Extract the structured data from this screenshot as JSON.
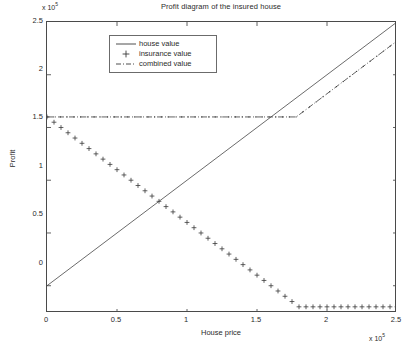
{
  "figure": {
    "title": "Profit diagram of the insured house",
    "background": "#ffffff",
    "axis_color": "#4a4a4a",
    "text_color": "#2b2b2b"
  },
  "axes": {
    "x_label": "House price",
    "y_label": "Profit",
    "x_exponent_base": "x 10",
    "x_exponent_power": "5",
    "y_exponent_base": "x 10",
    "y_exponent_power": "5",
    "x_ticks": [
      "0",
      "0.5",
      "1",
      "1.5",
      "2",
      "2.5"
    ],
    "y_ticks": [
      "0",
      "0.5",
      "1",
      "1.5",
      "2",
      "2.5"
    ]
  },
  "legend": {
    "entries": [
      {
        "label": "house value",
        "style": "solid-line",
        "color": "#3a3a3a"
      },
      {
        "label": "insurance value",
        "style": "plus-marker",
        "color": "#3a3a3a"
      },
      {
        "label": "combined value",
        "style": "dash-dot-line",
        "color": "#3a3a3a"
      }
    ]
  },
  "chart_data": {
    "type": "line",
    "title": "Profit diagram of the insured house",
    "xlabel": "House price",
    "ylabel": "Profit",
    "x_scale_exponent": 5,
    "y_scale_exponent": 5,
    "xlim": [
      0,
      250000
    ],
    "ylim": [
      -25862,
      250000
    ],
    "x_ticks": [
      0,
      50000,
      100000,
      150000,
      200000,
      250000
    ],
    "y_ticks": [
      0,
      50000,
      100000,
      150000,
      200000,
      250000
    ],
    "grid": false,
    "legend_position": "upper-left-inside",
    "annotations": [],
    "series": [
      {
        "name": "house value",
        "style": "solid-line",
        "marker": "none",
        "color": "#3a3a3a",
        "description": "Straight line y = x from origin to top right.",
        "x": [
          0,
          250000
        ],
        "y": [
          0,
          250000
        ]
      },
      {
        "name": "insurance value",
        "style": "markers-only",
        "marker": "+",
        "color": "#3a3a3a",
        "description": "Declines linearly from 1.6e5 at x=0 down to -0.2e5 at x=1.78e5, then constant at -0.2e5.",
        "breakpoint_x": 178000,
        "floor_y": -20000,
        "x": [
          0,
          5000,
          10000,
          15000,
          20000,
          25000,
          30000,
          35000,
          40000,
          45000,
          50000,
          55000,
          60000,
          65000,
          70000,
          75000,
          80000,
          85000,
          90000,
          95000,
          100000,
          105000,
          110000,
          115000,
          120000,
          125000,
          130000,
          135000,
          140000,
          145000,
          150000,
          155000,
          160000,
          165000,
          170000,
          175000,
          180000,
          185000,
          190000,
          195000,
          200000,
          205000,
          210000,
          215000,
          220000,
          225000,
          230000,
          235000,
          240000,
          245000,
          250000
        ],
        "y": [
          160000,
          155000,
          150000,
          145000,
          140000,
          135000,
          130000,
          125000,
          120000,
          115000,
          110000,
          105000,
          100000,
          95000,
          90000,
          85000,
          80000,
          75000,
          70000,
          65000,
          60000,
          55000,
          50000,
          45000,
          40000,
          35000,
          30000,
          25000,
          20000,
          15000,
          10000,
          5000,
          0,
          -5000,
          -10000,
          -15000,
          -20000,
          -20000,
          -20000,
          -20000,
          -20000,
          -20000,
          -20000,
          -20000,
          -20000,
          -20000,
          -20000,
          -20000,
          -20000,
          -20000,
          -20000
        ]
      },
      {
        "name": "combined value",
        "style": "dash-dot-line",
        "marker": "dot",
        "color": "#3a3a3a",
        "description": "Constant at 1.6e5 until x=1.78e5, then rises with slope 1 to 2.32e5 at x=2.5e5.",
        "breakpoint_x": 178000,
        "plateau_y": 160000,
        "x": [
          0,
          178000,
          250000
        ],
        "y": [
          160000,
          160000,
          232000
        ]
      }
    ]
  }
}
